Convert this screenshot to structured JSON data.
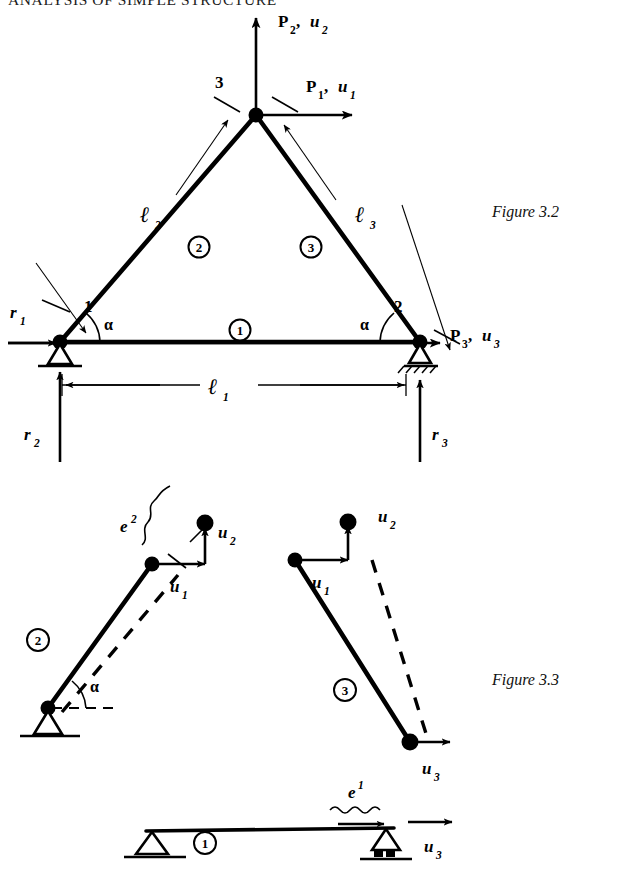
{
  "page": {
    "running_head": "ANALYSIS OF SIMPLE STRUCTURE",
    "width": 634,
    "height": 887,
    "ink_color": "#000000",
    "paper_color": "#ffffff"
  },
  "figure_3_2": {
    "caption": "Figure 3.2",
    "description": "Two-bar triangular truss with pin support at node 1, roller support at node 2, and free apex node 3 carrying applied loads.",
    "nodes": [
      {
        "id": "1",
        "label": "1",
        "support": "pin"
      },
      {
        "id": "2",
        "label": "2",
        "support": "roller"
      },
      {
        "id": "3",
        "label": "3",
        "support": "free"
      }
    ],
    "members": [
      {
        "circled_label": "1",
        "length_symbol": "ℓ",
        "length_sub": "1",
        "between": "1-2"
      },
      {
        "circled_label": "2",
        "length_symbol": "ℓ",
        "length_sub": "2",
        "between": "1-3"
      },
      {
        "circled_label": "3",
        "length_symbol": "ℓ",
        "length_sub": "3",
        "between": "3-2"
      }
    ],
    "loads": [
      {
        "label": "P",
        "sub": "2",
        "label2": "u",
        "sub2": "2",
        "separator": " , ",
        "direction": "up",
        "at_node": "3"
      },
      {
        "label": "P",
        "sub": "1",
        "label2": "u",
        "sub2": "1",
        "separator": " , ",
        "direction": "right",
        "at_node": "3"
      },
      {
        "label": "P",
        "sub": "3",
        "label2": "u",
        "sub2": "3",
        "separator": " , ",
        "direction": "right",
        "at_node": "2"
      }
    ],
    "reactions": [
      {
        "label": "r",
        "sub": "1",
        "direction": "right",
        "at_node": "1"
      },
      {
        "label": "r",
        "sub": "2",
        "direction": "up",
        "at_node": "1"
      },
      {
        "label": "r",
        "sub": "3",
        "direction": "up",
        "at_node": "2"
      }
    ],
    "angles": [
      {
        "symbol": "α",
        "at_node": "1"
      },
      {
        "symbol": "α",
        "at_node": "2"
      }
    ],
    "dimension": {
      "symbol": "ℓ",
      "sub": "1",
      "spans": "node 1 to node 2"
    }
  },
  "figure_3_3": {
    "caption": "Figure 3.3",
    "description": "Exploded view of the three members showing element deformations e and nodal displacement components u.",
    "members": [
      {
        "circled_label": "2",
        "element_strain": {
          "symbol": "e",
          "superscript": "2"
        },
        "angle": "α",
        "support": "pin",
        "displacements": [
          {
            "label": "u",
            "sub": "1",
            "direction": "right"
          },
          {
            "label": "u",
            "sub": "2",
            "direction": "up"
          }
        ]
      },
      {
        "circled_label": "3",
        "support": "none",
        "displacements": [
          {
            "label": "u",
            "sub": "1",
            "direction": "right"
          },
          {
            "label": "u",
            "sub": "2",
            "direction": "up"
          },
          {
            "label": "u",
            "sub": "3",
            "direction": "right"
          }
        ]
      },
      {
        "circled_label": "1",
        "element_strain": {
          "symbol": "e",
          "superscript": "1"
        },
        "supports": [
          "pin",
          "roller"
        ],
        "displacements": [
          {
            "label": "u",
            "sub": "3",
            "direction": "right"
          }
        ]
      }
    ]
  }
}
